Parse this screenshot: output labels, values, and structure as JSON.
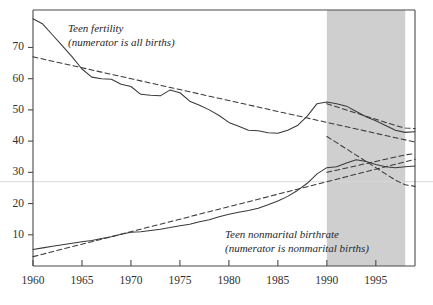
{
  "chart_data": {
    "type": "line",
    "title": "",
    "xlabel": "",
    "ylabel": "",
    "xlim": [
      1960,
      1999
    ],
    "ylim": [
      0,
      82
    ],
    "grid": false,
    "gridline_values": [
      27
    ],
    "legend_position": "inline-annotations",
    "xticks": [
      1960,
      1965,
      1970,
      1975,
      1980,
      1985,
      1990,
      1995
    ],
    "xticklabels": [
      "1960",
      "1965",
      "1970",
      "1975",
      "1980",
      "1985",
      "1990",
      "1995"
    ],
    "yticks": [
      10,
      20,
      30,
      40,
      50,
      60,
      70
    ],
    "yticklabels": [
      "10",
      "20",
      "30",
      "40",
      "50",
      "60",
      "70"
    ],
    "shaded_region": {
      "start": 1990,
      "end": 1998,
      "color": "#cfcfcf",
      "label": ""
    },
    "annotations": [
      {
        "name": "teen-fertility-annotation",
        "line1": "Teen fertility",
        "line2": "(numerator is all births)",
        "x": 68,
        "y": 22
      },
      {
        "name": "teen-nonmarital-annotation",
        "line1": "Teen nonmarital birthrate",
        "line2": "(numerator is nonmarital births)",
        "x": 225,
        "y": 228
      }
    ],
    "x": [
      1960,
      1961,
      1962,
      1963,
      1964,
      1965,
      1966,
      1967,
      1968,
      1969,
      1970,
      1971,
      1972,
      1973,
      1974,
      1975,
      1976,
      1977,
      1978,
      1979,
      1980,
      1981,
      1982,
      1983,
      1984,
      1985,
      1986,
      1987,
      1988,
      1989,
      1990,
      1991,
      1992,
      1993,
      1994,
      1995,
      1996,
      1997,
      1998,
      1999
    ],
    "series": [
      {
        "name": "Teen fertility (numerator is all births)",
        "style": "solid",
        "color": "#3a3a3a",
        "values": [
          79.2,
          77.5,
          74.0,
          70.5,
          67.0,
          63.1,
          60.5,
          60.0,
          59.8,
          58.2,
          57.5,
          55.0,
          54.7,
          54.5,
          56.4,
          55.5,
          52.8,
          51.5,
          50.0,
          48.2,
          46.0,
          44.8,
          43.5,
          43.3,
          42.7,
          42.5,
          43.5,
          45.0,
          48.0,
          52.0,
          52.5,
          52.0,
          51.2,
          49.5,
          47.8,
          46.5,
          45.0,
          43.5,
          42.8,
          43.0
        ]
      },
      {
        "name": "Teen fertility trend",
        "style": "dashed",
        "color": "#3a3a3a",
        "values": [
          67.0,
          66.3,
          65.6,
          64.9,
          64.2,
          63.5,
          62.8,
          62.1,
          61.4,
          60.7,
          60.0,
          59.3,
          58.6,
          57.9,
          57.2,
          56.5,
          55.8,
          55.1,
          54.4,
          53.7,
          53.0,
          52.3,
          51.6,
          50.9,
          50.2,
          49.5,
          48.8,
          48.1,
          47.4,
          46.7,
          46.0,
          45.3,
          44.6,
          43.9,
          43.2,
          42.5,
          41.8,
          41.1,
          40.4,
          39.7
        ]
      },
      {
        "name": "Teen nonmarital birthrate",
        "style": "solid",
        "color": "#3a3a3a",
        "values": [
          5.3,
          5.8,
          6.3,
          6.8,
          7.3,
          7.8,
          8.2,
          8.8,
          9.4,
          10.2,
          10.8,
          11.0,
          11.4,
          11.8,
          12.3,
          12.9,
          13.4,
          14.2,
          14.8,
          15.8,
          16.6,
          17.2,
          17.8,
          18.5,
          19.6,
          20.8,
          22.3,
          24.2,
          26.5,
          29.5,
          31.5,
          31.8,
          33.0,
          34.0,
          33.5,
          32.5,
          31.8,
          31.5,
          31.8,
          32.0
        ]
      },
      {
        "name": "Teen nonmarital trend",
        "style": "dashed",
        "color": "#3a3a3a",
        "values": [
          3.0,
          3.8,
          4.6,
          5.4,
          6.2,
          7.0,
          7.8,
          8.6,
          9.4,
          10.2,
          11.0,
          11.8,
          12.6,
          13.4,
          14.2,
          15.0,
          15.8,
          16.6,
          17.4,
          18.2,
          19.0,
          19.8,
          20.6,
          21.4,
          22.2,
          23.0,
          23.8,
          24.6,
          25.4,
          26.2,
          27.0,
          27.8,
          28.6,
          29.4,
          30.2,
          31.0,
          31.8,
          32.6,
          33.4,
          34.2
        ]
      },
      {
        "name": "Post-1990 teen fertility projection",
        "style": "dashed",
        "color": "#3a3a3a",
        "values": [
          null,
          null,
          null,
          null,
          null,
          null,
          null,
          null,
          null,
          null,
          null,
          null,
          null,
          null,
          null,
          null,
          null,
          null,
          null,
          null,
          null,
          null,
          null,
          null,
          null,
          null,
          null,
          null,
          null,
          null,
          52.0,
          51.0,
          50.0,
          49.0,
          48.0,
          47.0,
          46.0,
          45.0,
          44.2,
          44.0
        ]
      },
      {
        "name": "Post-1990 nonmarital projection",
        "style": "dashed",
        "color": "#3a3a3a",
        "values": [
          null,
          null,
          null,
          null,
          null,
          null,
          null,
          null,
          null,
          null,
          null,
          null,
          null,
          null,
          null,
          null,
          null,
          null,
          null,
          null,
          null,
          null,
          null,
          null,
          null,
          null,
          null,
          null,
          null,
          null,
          30.0,
          30.7,
          31.4,
          32.1,
          32.8,
          33.5,
          34.2,
          34.9,
          35.6,
          36.0
        ]
      },
      {
        "name": "Descending crossing projection",
        "style": "dashed",
        "color": "#3a3a3a",
        "values": [
          null,
          null,
          null,
          null,
          null,
          null,
          null,
          null,
          null,
          null,
          null,
          null,
          null,
          null,
          null,
          null,
          null,
          null,
          null,
          null,
          null,
          null,
          null,
          null,
          null,
          null,
          null,
          null,
          null,
          null,
          41.5,
          39.5,
          37.5,
          35.5,
          33.5,
          31.5,
          29.5,
          27.5,
          26.0,
          25.5
        ]
      }
    ]
  },
  "axes": {
    "y_tick_labels": [
      "70",
      "60",
      "50",
      "40",
      "30",
      "20",
      "10"
    ],
    "x_tick_labels": [
      "1960",
      "1965",
      "1970",
      "1975",
      "1980",
      "1985",
      "1990",
      "1995"
    ]
  },
  "colors": {
    "line": "#3a3a3a",
    "axis": "#4a4a48",
    "shade": "#cfcfcf",
    "gridline": "#d8d8d6",
    "text": "#2a2a2c"
  }
}
